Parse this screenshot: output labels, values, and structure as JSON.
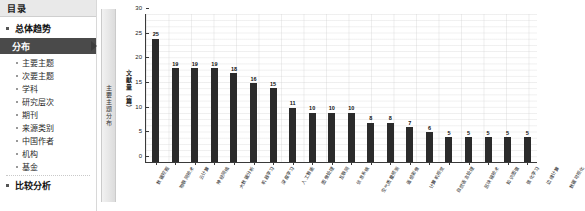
{
  "sidebar": {
    "header_title": "目录",
    "items": [
      {
        "label": "总体趋势",
        "type": "top"
      },
      {
        "label": "分布",
        "type": "selected"
      },
      {
        "label": "主要主题",
        "type": "sub"
      },
      {
        "label": "次要主题",
        "type": "sub"
      },
      {
        "label": "学科",
        "type": "sub"
      },
      {
        "label": "研究层次",
        "type": "sub"
      },
      {
        "label": "期刊",
        "type": "sub"
      },
      {
        "label": "来源类别",
        "type": "sub"
      },
      {
        "label": "中国作者",
        "type": "sub"
      },
      {
        "label": "机构",
        "type": "sub"
      },
      {
        "label": "基金",
        "type": "sub"
      },
      {
        "label": "比较分析",
        "type": "top"
      }
    ]
  },
  "vertical_tab": {
    "label": "主要主题分布"
  },
  "chart_data": {
    "type": "bar",
    "title": "",
    "xlabel": "",
    "ylabel": "文献量（篇）",
    "ylim": [
      0,
      30
    ],
    "yticks": [
      0,
      5,
      10,
      15,
      20,
      25,
      30
    ],
    "grid": true,
    "legend": "none",
    "categories": [
      "数据挖掘",
      "物联网技术",
      "云计算",
      "神经网络",
      "大数据分析",
      "机器学习",
      "深度学习",
      "人工智能",
      "图像处理",
      "互联网",
      "信息系统",
      "空气质量预测",
      "遥感影像",
      "计算机视觉",
      "自然语言处理",
      "区块链技术",
      "知识图谱",
      "强化学习",
      "边缘计算",
      "数据可视化"
    ],
    "values": [
      25,
      19,
      19,
      19,
      18,
      16,
      15,
      11,
      10,
      10,
      10,
      8,
      8,
      7,
      6,
      5,
      5,
      5,
      5,
      5
    ],
    "bar_color": "#2b2b2b"
  }
}
